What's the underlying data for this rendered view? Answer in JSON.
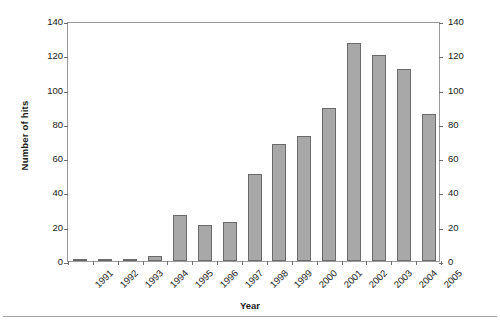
{
  "chart_data": {
    "type": "bar",
    "title": "",
    "xlabel": "Year",
    "ylabel": "Number of hits",
    "categories": [
      "1991",
      "1992",
      "1993",
      "1994",
      "1995",
      "1996",
      "1997",
      "1998",
      "1999",
      "2000",
      "2001",
      "2002",
      "2003",
      "2004",
      "2005"
    ],
    "values": [
      1,
      1,
      1,
      3,
      27,
      21,
      23,
      51,
      68,
      73,
      89,
      127,
      120,
      112,
      86
    ],
    "ylim": [
      0,
      140
    ],
    "ytick_step": 20,
    "yticks": [
      0,
      20,
      40,
      60,
      80,
      100,
      120,
      140
    ],
    "ytick_labels_left": [
      "0",
      "20",
      "40",
      "60",
      "80",
      "100",
      "120",
      "140"
    ],
    "ytick_labels_right": [
      "0",
      "20",
      "40",
      "60",
      "80",
      "100",
      "120",
      "140"
    ],
    "right_axis": true,
    "grid": false,
    "legend": null,
    "bar_color": "#a8a8a8",
    "bar_border_color": "#6a6a6a",
    "axis_color": "#9a9a9a"
  }
}
